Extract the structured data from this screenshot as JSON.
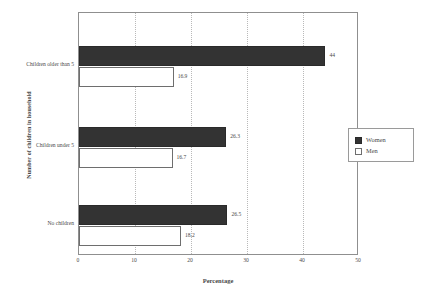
{
  "chart_data": {
    "type": "bar",
    "orientation": "horizontal",
    "title": "",
    "xlabel": "Percentage",
    "ylabel": "Number of children in household",
    "categories": [
      "Children older than 5",
      "Children under 5",
      "No children"
    ],
    "series": [
      {
        "name": "Women",
        "color": "#333333",
        "values": [
          44,
          26.3,
          26.5
        ]
      },
      {
        "name": "Men",
        "color": "#ffffff",
        "values": [
          16.9,
          16.7,
          18.2
        ]
      }
    ],
    "value_labels": {
      "Children older than 5": {
        "Women": "44",
        "Men": "16.9"
      },
      "Children under 5": {
        "Women": "26.3",
        "Men": "16.7"
      },
      "No children": {
        "Women": "26.5",
        "Men": "18.2"
      }
    },
    "xlim": [
      0,
      50
    ],
    "xticks": [
      0,
      10,
      20,
      30,
      40,
      50
    ],
    "xtick_labels": [
      "0",
      "10",
      "20",
      "30",
      "40",
      "50"
    ],
    "grid": "vertical-dotted",
    "legend_position": "right"
  },
  "legend": {
    "entries": [
      {
        "label": "Women",
        "swatch": "filled-dark-square"
      },
      {
        "label": "Men",
        "swatch": "open-white-square"
      }
    ]
  }
}
